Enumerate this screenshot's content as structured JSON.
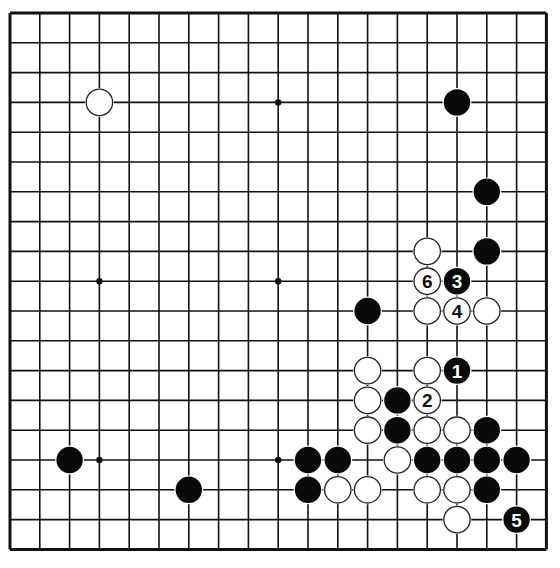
{
  "board": {
    "size": 19,
    "origin_x": 10,
    "origin_y": 13,
    "spacing": 29.8,
    "stone_radius": 13.2,
    "colors": {
      "background": "#ffffff",
      "line": "#111111",
      "black_stone": "#0a0a0a",
      "white_stone": "#ffffff",
      "white_stone_outline": "#222222",
      "black_label": "#ffffff",
      "white_label": "#111111"
    },
    "star_points": [
      [
        3,
        3
      ],
      [
        9,
        3
      ],
      [
        15,
        3
      ],
      [
        3,
        9
      ],
      [
        9,
        9
      ],
      [
        15,
        9
      ],
      [
        3,
        15
      ],
      [
        9,
        15
      ],
      [
        15,
        15
      ]
    ],
    "stones": [
      {
        "color": "white",
        "col": 3,
        "row": 3,
        "label": ""
      },
      {
        "color": "black",
        "col": 15,
        "row": 3,
        "label": ""
      },
      {
        "color": "black",
        "col": 16,
        "row": 6,
        "label": ""
      },
      {
        "color": "white",
        "col": 14,
        "row": 8,
        "label": ""
      },
      {
        "color": "black",
        "col": 16,
        "row": 8,
        "label": ""
      },
      {
        "color": "white",
        "col": 14,
        "row": 9,
        "label": "6"
      },
      {
        "color": "black",
        "col": 15,
        "row": 9,
        "label": "3"
      },
      {
        "color": "black",
        "col": 12,
        "row": 10,
        "label": ""
      },
      {
        "color": "white",
        "col": 14,
        "row": 10,
        "label": ""
      },
      {
        "color": "white",
        "col": 15,
        "row": 10,
        "label": "4"
      },
      {
        "color": "white",
        "col": 16,
        "row": 10,
        "label": ""
      },
      {
        "color": "white",
        "col": 12,
        "row": 12,
        "label": ""
      },
      {
        "color": "white",
        "col": 14,
        "row": 12,
        "label": ""
      },
      {
        "color": "black",
        "col": 15,
        "row": 12,
        "label": "1"
      },
      {
        "color": "white",
        "col": 12,
        "row": 13,
        "label": ""
      },
      {
        "color": "black",
        "col": 13,
        "row": 13,
        "label": ""
      },
      {
        "color": "white",
        "col": 14,
        "row": 13,
        "label": "2"
      },
      {
        "color": "white",
        "col": 12,
        "row": 14,
        "label": ""
      },
      {
        "color": "black",
        "col": 13,
        "row": 14,
        "label": ""
      },
      {
        "color": "white",
        "col": 14,
        "row": 14,
        "label": ""
      },
      {
        "color": "white",
        "col": 15,
        "row": 14,
        "label": ""
      },
      {
        "color": "black",
        "col": 16,
        "row": 14,
        "label": ""
      },
      {
        "color": "black",
        "col": 2,
        "row": 15,
        "label": ""
      },
      {
        "color": "black",
        "col": 10,
        "row": 15,
        "label": ""
      },
      {
        "color": "black",
        "col": 11,
        "row": 15,
        "label": ""
      },
      {
        "color": "white",
        "col": 13,
        "row": 15,
        "label": ""
      },
      {
        "color": "black",
        "col": 14,
        "row": 15,
        "label": ""
      },
      {
        "color": "black",
        "col": 15,
        "row": 15,
        "label": ""
      },
      {
        "color": "black",
        "col": 16,
        "row": 15,
        "label": ""
      },
      {
        "color": "black",
        "col": 17,
        "row": 15,
        "label": ""
      },
      {
        "color": "black",
        "col": 6,
        "row": 16,
        "label": ""
      },
      {
        "color": "black",
        "col": 10,
        "row": 16,
        "label": ""
      },
      {
        "color": "white",
        "col": 11,
        "row": 16,
        "label": ""
      },
      {
        "color": "white",
        "col": 12,
        "row": 16,
        "label": ""
      },
      {
        "color": "white",
        "col": 14,
        "row": 16,
        "label": ""
      },
      {
        "color": "white",
        "col": 15,
        "row": 16,
        "label": ""
      },
      {
        "color": "black",
        "col": 16,
        "row": 16,
        "label": ""
      },
      {
        "color": "white",
        "col": 15,
        "row": 17,
        "label": ""
      },
      {
        "color": "black",
        "col": 17,
        "row": 17,
        "label": "5"
      }
    ]
  }
}
